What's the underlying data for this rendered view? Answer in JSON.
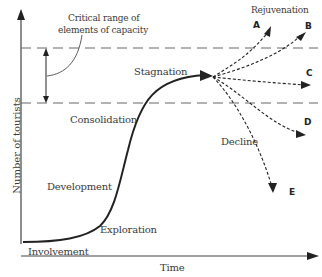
{
  "diagram": {
    "axes": {
      "x_label": "Time",
      "y_label": "Number of tourists"
    },
    "capacity_note": {
      "line1": "Critical range of",
      "line2": "elements of capacity"
    },
    "stages": {
      "involvement": "Involvement",
      "exploration": "Exploration",
      "development": "Development",
      "consolidation": "Consolidation",
      "stagnation": "Stagnation",
      "rejuvenation": "Rejuvenation",
      "decline": "Decline"
    },
    "branches": [
      "A",
      "B",
      "C",
      "D",
      "E"
    ],
    "colors": {
      "line": "#222222",
      "dash": "#555555",
      "text": "#3a3a3a"
    }
  }
}
